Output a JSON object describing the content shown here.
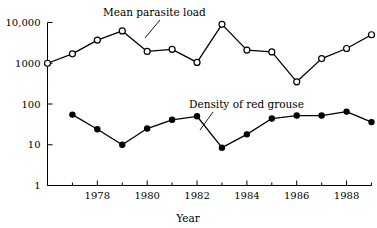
{
  "chart_data": {
    "type": "line",
    "title": "",
    "xlabel": "Year",
    "ylabel": "",
    "yscale": "log",
    "ylim": [
      1,
      10000
    ],
    "xlim": [
      1976,
      1989
    ],
    "grid": false,
    "legend_position": "inline-annotations",
    "y_ticks": [
      {
        "value": 10000,
        "label": "10,000"
      },
      {
        "value": 1000,
        "label": "1000"
      },
      {
        "value": 100,
        "label": "100"
      },
      {
        "value": 10,
        "label": "10"
      },
      {
        "value": 1,
        "label": "1"
      }
    ],
    "x_ticks_major": [
      {
        "value": 1978,
        "label": "1978"
      },
      {
        "value": 1980,
        "label": "1980"
      },
      {
        "value": 1982,
        "label": "1982"
      },
      {
        "value": 1984,
        "label": "1984"
      },
      {
        "value": 1986,
        "label": "1986"
      },
      {
        "value": 1988,
        "label": "1988"
      }
    ],
    "x_ticks_minor": [
      1977,
      1979,
      1981,
      1983,
      1985,
      1987,
      1989
    ],
    "series": [
      {
        "name": "Mean parasite load",
        "marker": "open-circle",
        "x": [
          1976,
          1977,
          1978,
          1979,
          1980,
          1981,
          1982,
          1983,
          1984,
          1985,
          1986,
          1987,
          1988,
          1989
        ],
        "values": [
          1000,
          1700,
          3700,
          6200,
          1950,
          2200,
          1050,
          9000,
          2100,
          1900,
          350,
          1300,
          2300,
          5000
        ]
      },
      {
        "name": "Density of red grouse",
        "marker": "filled-circle",
        "x": [
          1977,
          1978,
          1979,
          1980,
          1981,
          1982,
          1983,
          1984,
          1985,
          1986,
          1987,
          1988,
          1989
        ],
        "values": [
          55,
          24,
          10,
          25,
          41,
          50,
          8.5,
          18,
          44,
          52,
          52,
          65,
          36
        ]
      }
    ],
    "annotations": [
      {
        "text": "Mean parasite load",
        "label_x": 103,
        "label_y": 16,
        "leader": {
          "x1": 160,
          "y1": 20,
          "x2": 145,
          "y2": 38
        }
      },
      {
        "text": "Density of red grouse",
        "label_x": 189,
        "label_y": 108,
        "leader": {
          "x1": 213,
          "y1": 112,
          "x2": 200,
          "y2": 130
        }
      }
    ],
    "colors": {
      "axis": "#000000",
      "line": "#000000",
      "background": "#ffffff",
      "marker_open_fill": "#ffffff",
      "marker_filled_fill": "#000000"
    }
  }
}
